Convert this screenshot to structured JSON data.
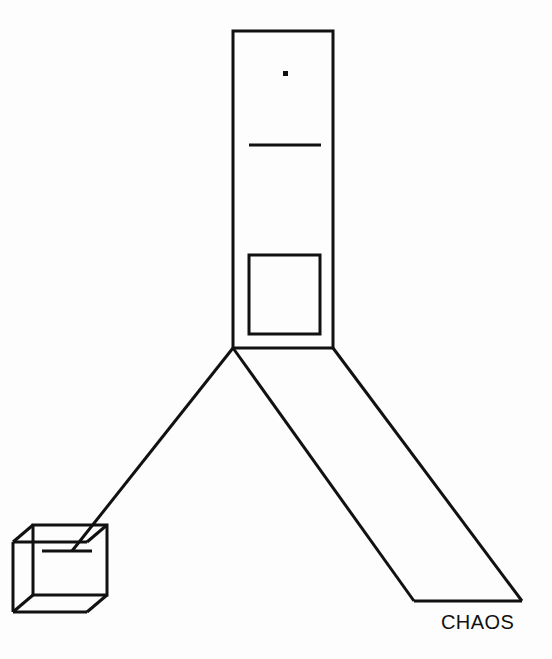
{
  "page": {
    "title": "CHAOS",
    "background_color": "#fdfdfd",
    "ink_color": "#111111",
    "width": 552,
    "height": 659
  },
  "caption": {
    "text": "CHAOS",
    "x": 441,
    "y": 612,
    "font_size": 20,
    "color": "#111111"
  },
  "figure": {
    "shapes": {
      "tower_rect": {
        "name": "tall-vertical-rectangle",
        "x": 233,
        "y": 31,
        "width": 100,
        "height": 317,
        "stroke_width": 3
      },
      "dot": {
        "name": "small-filled-square-dot",
        "x": 283,
        "y": 71,
        "size": 5
      },
      "upper_line": {
        "name": "horizontal-rule-upper",
        "x1": 249,
        "y1": 145,
        "x2": 321,
        "y2": 145,
        "stroke_width": 3
      },
      "inner_square": {
        "name": "inner-square",
        "x": 249,
        "y": 255,
        "width": 71,
        "height": 79,
        "stroke_width": 3
      },
      "leg_left": {
        "name": "leg-left-to-cube",
        "x1": 233,
        "y1": 348,
        "x2": 72,
        "y2": 551,
        "stroke_width": 3
      },
      "leg_middle": {
        "name": "leg-middle-diagonal",
        "x1": 233,
        "y1": 348,
        "x2": 414,
        "y2": 601,
        "stroke_width": 3
      },
      "leg_right": {
        "name": "leg-right-diagonal",
        "x1": 333,
        "y1": 348,
        "x2": 522,
        "y2": 601,
        "stroke_width": 3
      },
      "base_line": {
        "name": "base-horizontal-line",
        "x1": 414,
        "y1": 601,
        "x2": 522,
        "y2": 601,
        "stroke_width": 3
      },
      "cube": {
        "name": "wireframe-cube",
        "front_face": {
          "x": 33,
          "y": 525,
          "width": 74,
          "height": 70
        },
        "depth_dx": -20,
        "depth_dy": 17,
        "stroke_width": 3
      },
      "cube_inner_line": {
        "name": "cube-inner-horizontal-line",
        "x1": 42,
        "y1": 551,
        "x2": 92,
        "y2": 551,
        "stroke_width": 3
      }
    }
  }
}
